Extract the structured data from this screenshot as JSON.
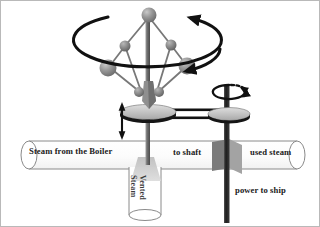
{
  "diagram": {
    "type": "mechanical-schematic",
    "background_color": "#ffffff",
    "border_color": "#b9b9b9"
  },
  "labels": {
    "steam_from_boiler": "Steam from the Boiler",
    "to_shaft": "to shaft",
    "used_steam": "used steam",
    "power_to_ship": "power to ship",
    "vented_steam_line1": "Vented",
    "vented_steam_line2": "Steam"
  },
  "colors": {
    "pipe_fill": "#fbfbfb",
    "pipe_outline": "#7a7a7a",
    "ball_mid": "#8e8e8e",
    "ball_dark": "#6a6a6a",
    "ball_light": "#b5b5b5",
    "disc_fill": "#c8c8c8",
    "disc_edge": "#8c8c8c",
    "shaft_dark": "#222222",
    "shaft_mid": "#6e6e6e",
    "arrow_black": "#111111",
    "valve_plate": "#8a8a8a",
    "vent_steam_fill": "#cfcfcf",
    "text": "#1a1a1a"
  },
  "components": {
    "governor": {
      "name": "flyball-governor",
      "pivot_ball": {
        "cx": 148,
        "cy": 14,
        "r": 7
      },
      "flyballs": [
        {
          "cx": 107,
          "cy": 67,
          "r": 8
        },
        {
          "cx": 186,
          "cy": 65,
          "r": 8
        }
      ],
      "joint_balls": [
        {
          "cx": 124,
          "cy": 45,
          "r": 5
        },
        {
          "cx": 170,
          "cy": 44,
          "r": 5
        }
      ],
      "sleeve_balls": [
        {
          "cx": 139,
          "cy": 91,
          "r": 4.5
        },
        {
          "cx": 157,
          "cy": 91,
          "r": 4.5
        }
      ],
      "rotation_ring": {
        "cx": 148,
        "cy": 48,
        "rx": 74,
        "ry": 27,
        "arrowheads": 2,
        "direction": "clockwise-viewed-from-above"
      }
    },
    "sliding_collar": {
      "name": "sliding-collar-disc",
      "cx": 147,
      "cy": 112,
      "rx": 28,
      "ry": 7
    },
    "vertical_travel_arrow": {
      "name": "collar-travel-arrow",
      "x": 121,
      "y_top": 103,
      "y_bottom": 136,
      "double_headed": true
    },
    "right_pulley": {
      "name": "drive-pulley",
      "cx": 229,
      "cy": 113,
      "rx": 21,
      "ry": 6
    },
    "right_rotation_arrow": {
      "name": "shaft-rotation-arrow",
      "cx": 228,
      "cy": 91,
      "rx": 17,
      "ry": 7
    },
    "drive_belt": {
      "name": "drive-belt",
      "from_x": 160,
      "to_x": 226,
      "y_top": 109,
      "y_bottom": 117
    },
    "main_pipe": {
      "name": "steam-pipe",
      "x": 12,
      "y": 140,
      "width": 296,
      "height": 28,
      "left_cap_open": true,
      "right_cap_open": true
    },
    "vent_pipe": {
      "name": "vent-pipe",
      "x": 128,
      "y": 168,
      "width": 32,
      "height": 52
    },
    "vent_funnel": {
      "name": "vent-funnel",
      "top_width": 18,
      "bottom_width": 28,
      "y": 158,
      "height": 18
    },
    "throttle_valve": {
      "name": "throttle-valve-plate",
      "x": 212,
      "y": 142,
      "width": 28,
      "height": 28
    },
    "governor_shaft": {
      "name": "governor-shaft",
      "x": 145,
      "y_top": 14,
      "y_bottom": 170
    },
    "output_shaft": {
      "name": "output-shaft",
      "x": 226,
      "y_top": 84,
      "y_bottom": 222
    }
  }
}
